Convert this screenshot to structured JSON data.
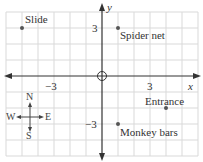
{
  "grid": {
    "unit_px": 16,
    "origin_px": [
      102,
      76
    ],
    "x_range": [
      -6,
      6
    ],
    "y_range": [
      -5,
      4
    ],
    "line_color": "#d8d8d8",
    "axis_color": "#333333"
  },
  "axes": {
    "x_label": "x",
    "y_label": "y",
    "x_ticks": [
      "−3",
      "3"
    ],
    "y_ticks": [
      "3",
      "−3"
    ]
  },
  "points": [
    {
      "name": "Slide",
      "x": -5,
      "y": 3
    },
    {
      "name": "Spider net",
      "x": 1,
      "y": 3
    },
    {
      "name": "Entrance",
      "x": 4,
      "y": -2
    },
    {
      "name": "Monkey bars",
      "x": 1,
      "y": -3
    }
  ],
  "compass": {
    "n": "N",
    "s": "S",
    "e": "E",
    "w": "W"
  }
}
